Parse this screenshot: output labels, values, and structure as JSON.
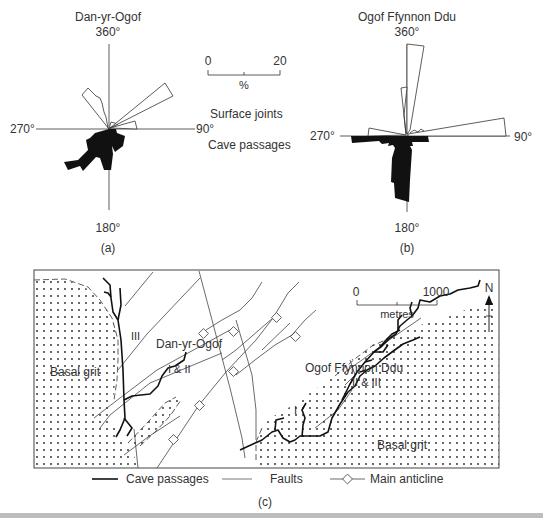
{
  "rose_a": {
    "title": "Dan-yr-Ogof",
    "deg_north": "360°",
    "deg_east": "90°",
    "deg_south": "180°",
    "deg_west": "270°",
    "caption": "(a)"
  },
  "rose_b": {
    "title": "Ogof Ffynnon Ddu",
    "deg_north": "360°",
    "deg_east": "90°",
    "deg_south": "180°",
    "deg_west": "270°",
    "caption": "(b)"
  },
  "rose_legend": {
    "scale_min": "0",
    "scale_max": "20",
    "scale_unit": "%",
    "upper_label": "Surface joints",
    "lower_label": "Cave passages"
  },
  "map": {
    "labels": {
      "basal_grit_west": "Basal grit",
      "basal_grit_east": "Basal grit",
      "passage_iii": "III",
      "dan_yr_ogof": "Dan-yr-Ogof",
      "passage_i_ii": "I & II",
      "ogof_ffynnon_ddu": "Ogof Ffynnon Ddu",
      "passage_ii_iii": "II & III",
      "passage_i": "I"
    },
    "scale": {
      "min": "0",
      "max": "1000",
      "unit": "metres"
    },
    "north": "N",
    "legend": {
      "cave_passages": "Cave passages",
      "faults": "Faults",
      "main_anticline": "Main anticline"
    },
    "caption": "(c)"
  }
}
